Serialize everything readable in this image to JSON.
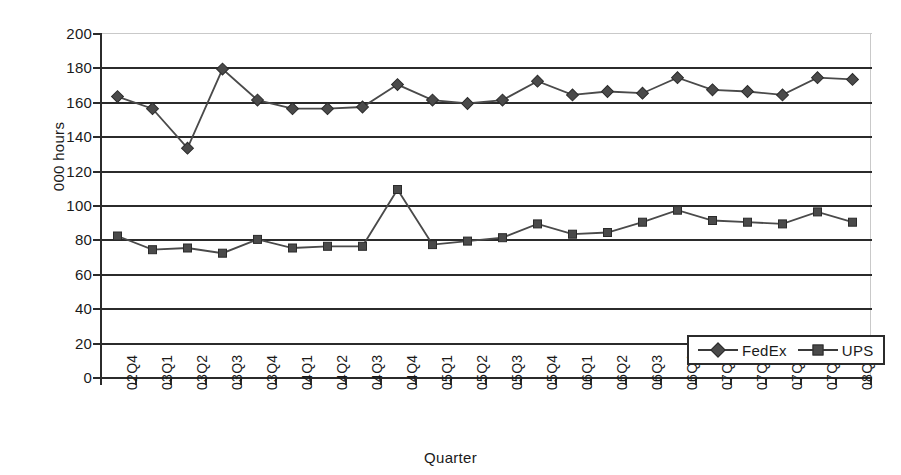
{
  "chart_data": {
    "type": "line",
    "title": "",
    "xlabel": "Quarter",
    "ylabel": "000 hours",
    "ylim": [
      0,
      200
    ],
    "ytick_step": 20,
    "grid": true,
    "legend_position": "bottom-right",
    "categories": [
      "02Q4",
      "03Q1",
      "03Q2",
      "03Q3",
      "03Q4",
      "04Q1",
      "04Q2",
      "04Q3",
      "04Q4",
      "05Q1",
      "05Q2",
      "05Q3",
      "05Q4",
      "06Q1",
      "06Q2",
      "06Q3",
      "06Q4",
      "07Q1",
      "07Q2",
      "07Q3",
      "07Q4",
      "08Q1"
    ],
    "yticks": [
      0,
      20,
      40,
      60,
      80,
      100,
      120,
      140,
      160,
      180,
      200
    ],
    "series": [
      {
        "name": "FedEx",
        "marker": "diamond",
        "color": "#4a4a4a",
        "values": [
          163,
          156,
          133,
          179,
          161,
          156,
          156,
          157,
          170,
          161,
          159,
          161,
          172,
          164,
          166,
          165,
          174,
          167,
          166,
          164,
          174,
          173
        ]
      },
      {
        "name": "UPS",
        "marker": "square",
        "color": "#4a4a4a",
        "values": [
          82,
          74,
          75,
          72,
          80,
          75,
          76,
          76,
          109,
          77,
          79,
          81,
          89,
          83,
          84,
          90,
          97,
          91,
          90,
          89,
          96,
          90
        ]
      }
    ]
  },
  "colors": {
    "axis": "#2b2b2b",
    "gridline": "#2b2b2b",
    "series": "#4a4a4a",
    "background": "#ffffff"
  }
}
